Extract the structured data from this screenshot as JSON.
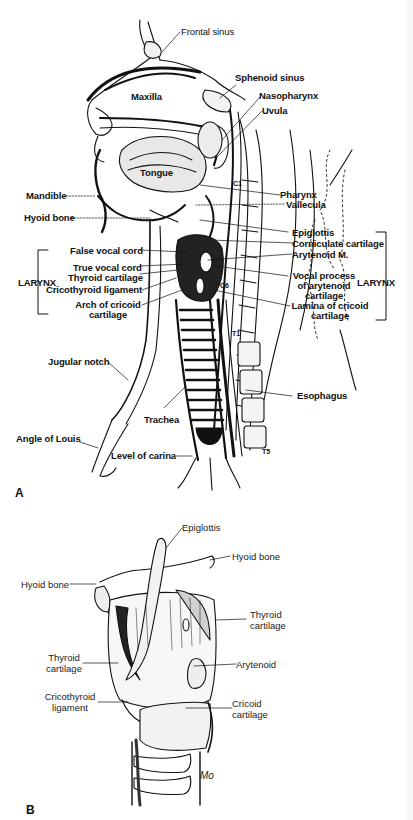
{
  "figure": {
    "panels": [
      {
        "id": "A",
        "letter": "A",
        "view": "Sagittal section of head and neck",
        "labels": {
          "frontal_sinus": "Frontal sinus",
          "sphenoid_sinus": "Sphenoid sinus",
          "maxilla": "Maxilla",
          "nasopharynx": "Nasopharynx",
          "uvula": "Uvula",
          "tongue": "Tongue",
          "mandible": "Mandible",
          "pharynx": "Pharynx",
          "vallecula": "Vallecula",
          "hyoid_bone": "Hyoid bone",
          "epiglottis": "Epiglottis",
          "corniculate_cartilage": "Corniculate cartilage",
          "false_vocal_cord": "False vocal cord",
          "arytenoid_m": "Arytenoid M.",
          "true_vocal_cord": "True vocal cord",
          "thyroid_cartilage": "Thyroid cartilage",
          "vocal_process_1": "Vocal process",
          "vocal_process_2": "of arytenoid",
          "vocal_process_3": "cartilage",
          "cricothyroid_ligament": "Cricothyroid ligament",
          "arch_cricoid_1": "Arch of cricoid",
          "arch_cricoid_2": "cartilage",
          "lamina_cricoid_1": "Lamina of cricoid",
          "lamina_cricoid_2": "cartilage",
          "larynx_left": "LARYNX",
          "larynx_right": "LARYNX",
          "jugular_notch": "Jugular notch",
          "esophagus": "Esophagus",
          "trachea": "Trachea",
          "angle_of_louis": "Angle of Louis",
          "level_of_carina": "Level of carina"
        },
        "vertebrae": {
          "c1": "C1",
          "c6": "C6",
          "t1": "T1",
          "t5": "T5"
        }
      },
      {
        "id": "B",
        "letter": "B",
        "view": "Anterior-oblique view of larynx",
        "labels": {
          "epiglottis": "Epiglottis",
          "hyoid_bone_right": "Hyoid bone",
          "hyoid_bone_left": "Hyoid bone",
          "thyroid_cartilage_right_1": "Thyroid",
          "thyroid_cartilage_right_2": "cartilage",
          "thyroid_cartilage_left_1": "Thyroid",
          "thyroid_cartilage_left_2": "cartilage",
          "arytenoid": "Arytenoid",
          "cricothyroid_ligament_1": "Cricothyroid",
          "cricothyroid_ligament_2": "ligament",
          "cricoid_cartilage_1": "Cricoid",
          "cricoid_cartilage_2": "cartilage"
        },
        "signature": "Mo"
      }
    ],
    "colors": {
      "ink": "#111111",
      "background": "#ffffff"
    }
  }
}
